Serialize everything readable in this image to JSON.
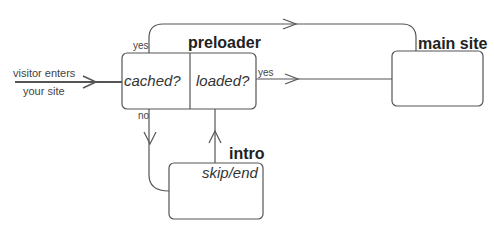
{
  "diagram": {
    "entry": {
      "line1": "visitor enters",
      "line2": "your site"
    },
    "preloader": {
      "title": "preloader",
      "cell_left": "cached?",
      "cell_right": "loaded?"
    },
    "main_site": {
      "title": "main site"
    },
    "intro": {
      "title": "intro",
      "subtitle": "skip/end"
    },
    "edges": {
      "cached_yes": "yes",
      "loaded_yes": "yes",
      "cached_no": "no"
    },
    "colors": {
      "stroke": "#555555",
      "text": "#333333"
    }
  }
}
